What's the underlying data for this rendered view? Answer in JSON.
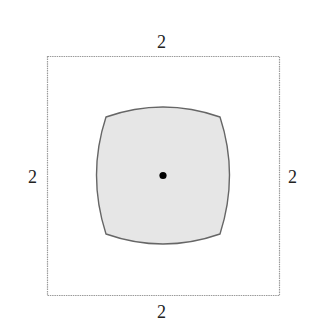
{
  "diagram": {
    "outer_square": {
      "stroke": "#9a9a9a",
      "fill": "none"
    },
    "inner_shape": {
      "stroke": "#666666",
      "fill": "#e6e6e6"
    },
    "center_point": {
      "fill": "#000000"
    },
    "labels": {
      "top": "2",
      "left": "2",
      "right": "2",
      "bottom": "2"
    }
  }
}
